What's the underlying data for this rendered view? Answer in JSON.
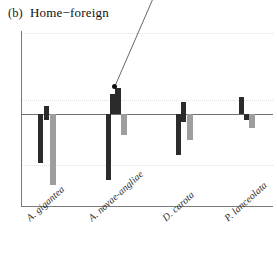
{
  "figure": {
    "panel_tag": "(b)",
    "title": "Home−foreign"
  },
  "annotation": {
    "leader_label": "",
    "dot_x": 114,
    "dot_y": 86
  },
  "axes": {
    "zero_line_visible": true,
    "grid": "dotted",
    "y_axis_visible": true,
    "x_axis_visible": true
  },
  "colors": {
    "dark_bar": "#2b2b2b",
    "gray_bar": "#9e9e9e",
    "axis": "#7a7a7a",
    "gridline": "#e3e0dc",
    "text": "#1a1a1a"
  },
  "xlabels": [
    {
      "label": "A. gigantea"
    },
    {
      "label": "A. novae-angliae"
    },
    {
      "label": "D. carota"
    },
    {
      "label": "P. lanceolata"
    }
  ],
  "chart_data": {
    "type": "bar",
    "title": "(b) Home−foreign",
    "xlabel": "",
    "ylabel": "",
    "ylim": [
      -93,
      83
    ],
    "grid": true,
    "legend": "none",
    "orientation": "vertical",
    "baseline": 0,
    "note": "Deviation bars above/below a zero line; dark = one treatment, gray = another. Values are in plot pixel units relative to the zero line (positive = up).",
    "categories": [
      "A. gigantea",
      "A. novae-angliae",
      "D. carota",
      "P. lanceolata"
    ],
    "series": [
      {
        "name": "dark",
        "color": "#2b2b2b",
        "bars": [
          {
            "group": 0,
            "offset": 17,
            "width": 5,
            "value": -49
          },
          {
            "group": 0,
            "offset": 23,
            "width": 5,
            "value": 8
          },
          {
            "group": 0,
            "offset": 23,
            "width": 5,
            "value": -6
          },
          {
            "group": 1,
            "offset": 85,
            "width": 5,
            "value": -66
          },
          {
            "group": 1,
            "offset": 89,
            "width": 5,
            "value": 20
          },
          {
            "group": 1,
            "offset": 94,
            "width": 6,
            "value": 26
          },
          {
            "group": 2,
            "offset": 155,
            "width": 5,
            "value": -41
          },
          {
            "group": 2,
            "offset": 160,
            "width": 5,
            "value": 12
          },
          {
            "group": 2,
            "offset": 160,
            "width": 5,
            "value": -8
          },
          {
            "group": 3,
            "offset": 218,
            "width": 5,
            "value": 17
          },
          {
            "group": 3,
            "offset": 223,
            "width": 5,
            "value": -6
          }
        ]
      },
      {
        "name": "gray",
        "color": "#9e9e9e",
        "bars": [
          {
            "group": 0,
            "offset": 29,
            "width": 6,
            "value": -71
          },
          {
            "group": 1,
            "offset": 100,
            "width": 6,
            "value": -21
          },
          {
            "group": 2,
            "offset": 166,
            "width": 6,
            "value": -26
          },
          {
            "group": 3,
            "offset": 228,
            "width": 6,
            "value": -14
          }
        ]
      }
    ],
    "gridlines_y": [
      69,
      2,
      -51
    ]
  }
}
